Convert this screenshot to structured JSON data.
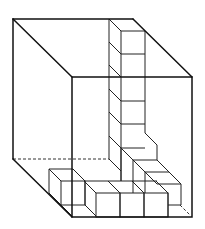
{
  "diagram": {
    "title": "Cubes arranged inside a transparent rectangular box",
    "colors": {
      "line": "#111111",
      "background": "#ffffff"
    },
    "box": {
      "front_face": {
        "x1": 72,
        "y1": 77,
        "x2": 192,
        "y2": 217
      },
      "back_face": {
        "x1": 13,
        "y1": 19,
        "x2": 133,
        "y2": 159
      },
      "hidden_edges": "dashed"
    },
    "cubes": {
      "unit_size_px": 24,
      "depth_offset_px": [
        -12,
        -12
      ],
      "vertical_column_count": 7,
      "bottom_front_row_count": 3,
      "bottom_left_row_count": 2,
      "back_row_step_count": 2
    }
  }
}
